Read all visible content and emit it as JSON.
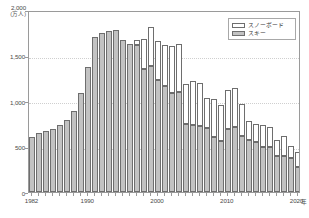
{
  "axes": {
    "y_unit_top": "2,000",
    "y_unit_caption": "(万人)",
    "y_ticks": [
      "2,000",
      "1,500",
      "1,000",
      "500",
      "0"
    ],
    "x_ticks": [
      "1982",
      "1990",
      "2000",
      "2010",
      "2020"
    ],
    "x_unit": "年"
  },
  "legend": {
    "items": [
      {
        "label": "スノーボード",
        "swatch": "snow",
        "color": "#ffffff"
      },
      {
        "label": "スキー",
        "swatch": "ski",
        "color": "#c2c2c2"
      }
    ]
  },
  "chart_data": {
    "type": "bar",
    "title": "",
    "subtitle": "",
    "xlabel": "年",
    "ylabel": "万人",
    "ylim": [
      0,
      2000
    ],
    "ytick_step": 500,
    "grid": true,
    "stacked": true,
    "legend_position": "top-right",
    "categories": [
      "1982",
      "1983",
      "1984",
      "1985",
      "1986",
      "1987",
      "1988",
      "1989",
      "1990",
      "1991",
      "1992",
      "1993",
      "1994",
      "1995",
      "1996",
      "1997",
      "1998",
      "1999",
      "2000",
      "2001",
      "2002",
      "2003",
      "2004",
      "2005",
      "2006",
      "2007",
      "2008",
      "2009",
      "2010",
      "2011",
      "2012",
      "2013",
      "2014",
      "2015",
      "2016",
      "2017",
      "2018",
      "2019",
      "2020"
    ],
    "series": [
      {
        "name": "スキー",
        "color": "#c2c2c2",
        "values": [
          600,
          650,
          670,
          690,
          740,
          790,
          890,
          1090,
          1370,
          1700,
          1750,
          1770,
          1780,
          1670,
          1630,
          1620,
          1350,
          1390,
          1230,
          1170,
          1090,
          1100,
          750,
          740,
          720,
          700,
          610,
          560,
          690,
          710,
          620,
          570,
          550,
          490,
          490,
          400,
          400,
          370,
          270
        ]
      },
      {
        "name": "スノーボード",
        "color": "#ffffff",
        "values": [
          0,
          0,
          0,
          0,
          0,
          0,
          0,
          0,
          0,
          0,
          0,
          0,
          0,
          0,
          0,
          50,
          330,
          420,
          430,
          450,
          510,
          530,
          440,
          480,
          480,
          330,
          410,
          400,
          430,
          430,
          350,
          210,
          200,
          250,
          230,
          170,
          220,
          140,
          170
        ]
      }
    ],
    "totals": [
      600,
      650,
      670,
      690,
      740,
      790,
      890,
      1090,
      1370,
      1700,
      1750,
      1770,
      1780,
      1670,
      1630,
      1620,
      1680,
      1810,
      1660,
      1620,
      1600,
      1630,
      1190,
      1220,
      1200,
      1030,
      1020,
      960,
      1120,
      1140,
      970,
      780,
      750,
      740,
      720,
      570,
      620,
      510,
      440
    ]
  }
}
